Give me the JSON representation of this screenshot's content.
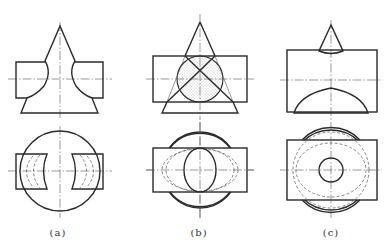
{
  "figure": {
    "panels": [
      {
        "id": "a",
        "label": "(a)",
        "label_x": 58,
        "description": "Cone intersecting horizontal cylinder, cylinder partially removed (two ear pieces)"
      },
      {
        "id": "b",
        "label": "(b)",
        "label_x": 199,
        "description": "Cone with horizontal cylindrical hole; shaded section and crossing cone generators"
      },
      {
        "id": "c",
        "label": "(c)",
        "label_x": 331,
        "description": "Small cone tip on cylinder with arched bottom; top view with small circle"
      }
    ]
  },
  "colors": {
    "line": "#2a2a2a",
    "centerline": "#555555",
    "hidden": "#666666",
    "hatch": "#888888"
  }
}
